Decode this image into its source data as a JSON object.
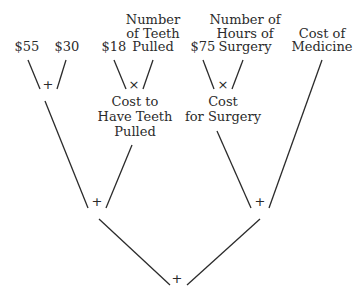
{
  "diagram": {
    "type": "expression-tree",
    "leaves": {
      "cost55": "$55",
      "cost30": "$30",
      "cost18": "$18",
      "teeth_count": [
        "Number",
        "of Teeth",
        "Pulled"
      ],
      "cost75": "$75",
      "hours_surgery": [
        "Number of",
        "Hours of",
        "Surgery"
      ],
      "medicine": [
        "Cost of",
        "Medicine"
      ]
    },
    "intermediate": {
      "teeth_cost": [
        "Cost to",
        "Have Teeth",
        "Pulled"
      ],
      "surgery_cost": [
        "Cost",
        "for Surgery"
      ]
    },
    "operators": {
      "plus_fees": "+",
      "times_teeth": "×",
      "times_surgery": "×",
      "plus_left": "+",
      "plus_right": "+",
      "plus_root": "+"
    }
  }
}
